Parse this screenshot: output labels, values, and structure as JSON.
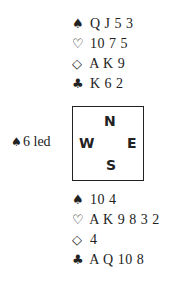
{
  "north": {
    "lines": [
      {
        "suit": "spades",
        "glyph": "♠",
        "cards": "Q J 5 3"
      },
      {
        "suit": "hearts",
        "glyph": "♡",
        "cards": "10 7 5"
      },
      {
        "suit": "diamonds",
        "glyph": "◇",
        "cards": "A K 9"
      },
      {
        "suit": "clubs",
        "glyph": "♣",
        "cards": "K 6 2"
      }
    ]
  },
  "compass": {
    "n": "N",
    "w": "W",
    "e": "E",
    "s": "S"
  },
  "lead": {
    "glyph": "♠",
    "text": "6 led"
  },
  "south": {
    "lines": [
      {
        "suit": "spades",
        "glyph": "♠",
        "cards": "10 4"
      },
      {
        "suit": "hearts",
        "glyph": "♡",
        "cards": "A K 9 8 3 2"
      },
      {
        "suit": "diamonds",
        "glyph": "◇",
        "cards": "4"
      },
      {
        "suit": "clubs",
        "glyph": "♣",
        "cards": "A Q 10 8"
      }
    ]
  }
}
